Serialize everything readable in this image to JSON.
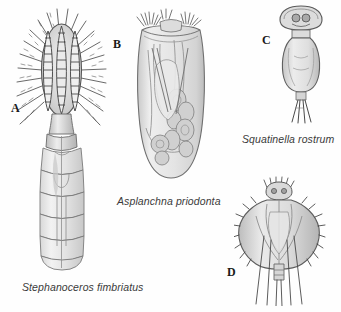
{
  "plate": {
    "background_color": "#fefefe",
    "width": 341,
    "height": 312,
    "ink_color": "#4a4a4a",
    "fill_light": "#e8e8e8",
    "fill_mid": "#cfcfcf",
    "fill_dark": "#9a9a9a"
  },
  "panels": [
    {
      "letter": "A",
      "caption": "Stephanoceros fimbriatus",
      "subject": "rotifer-with-coronal-arms-and-segmented-trunk"
    },
    {
      "letter": "B",
      "caption": "Asplanchna priodonta",
      "subject": "sac-shaped-transparent-rotifer-with-internal-organs"
    },
    {
      "letter": "C",
      "caption": "Squatinella rostrum",
      "subject": "hooded-rotifer-with-forked-toes"
    },
    {
      "letter": "D",
      "caption": "",
      "subject": "spined-loricate-rotifer-with-long-setae"
    }
  ]
}
